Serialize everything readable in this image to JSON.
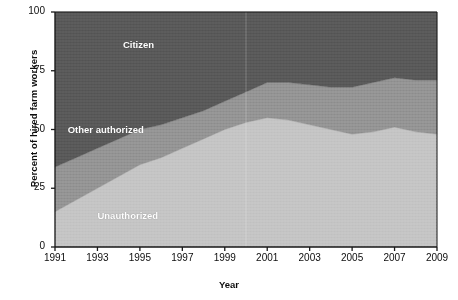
{
  "chart_data": {
    "type": "area",
    "title": "",
    "subtitle": "",
    "xlabel": "Year",
    "ylabel": "Percent of hired farm workers",
    "xlim": [
      1991,
      2009
    ],
    "ylim": [
      0,
      100
    ],
    "grid": false,
    "stacked": true,
    "legend_position": "inline-annotations",
    "x": [
      1991,
      1992,
      1993,
      1994,
      1995,
      1996,
      1997,
      1998,
      1999,
      2000,
      2001,
      2002,
      2003,
      2004,
      2005,
      2006,
      2007,
      2008,
      2009
    ],
    "series": [
      {
        "name": "Unauthorized",
        "color": "#c4c4c4",
        "values": [
          15,
          20,
          25,
          30,
          35,
          38,
          42,
          46,
          50,
          53,
          55,
          54,
          52,
          50,
          48,
          49,
          51,
          49,
          48
        ]
      },
      {
        "name": "Other authorized",
        "color": "#939393",
        "values": [
          19,
          18,
          17,
          16,
          15,
          14,
          13,
          12,
          12,
          13,
          15,
          16,
          17,
          18,
          20,
          21,
          21,
          22,
          23
        ]
      },
      {
        "name": "Citizen",
        "color": "#585858",
        "values": [
          66,
          62,
          58,
          54,
          50,
          48,
          45,
          42,
          38,
          34,
          30,
          30,
          31,
          32,
          32,
          30,
          28,
          29,
          29
        ]
      }
    ],
    "y_ticks": [
      0,
      25,
      50,
      75,
      100
    ],
    "y_tick_labels": [
      "0",
      "25",
      "50",
      "75",
      "100"
    ],
    "x_ticks": [
      1991,
      1993,
      1995,
      1997,
      1999,
      2001,
      2003,
      2005,
      2007,
      2009
    ],
    "x_tick_labels": [
      "1991",
      "1993",
      "1995",
      "1997",
      "1999",
      "2001",
      "2003",
      "2005",
      "2007",
      "2009"
    ],
    "annotations": [
      {
        "text": "Citizen",
        "x": 1994.2,
        "y": 86,
        "color": "#ffffff"
      },
      {
        "text": "Other authorized",
        "x": 1991.6,
        "y": 50,
        "color": "#ffffff"
      },
      {
        "text": "Unauthorized",
        "x": 1993.0,
        "y": 13,
        "color": "#ffffff"
      }
    ],
    "colors": {
      "citizen": "#585858",
      "other_authorized": "#939393",
      "unauthorized": "#c4c4c4",
      "axis": "#1a1a1a",
      "background": "#ffffff",
      "text": "#0d0d0d"
    }
  }
}
